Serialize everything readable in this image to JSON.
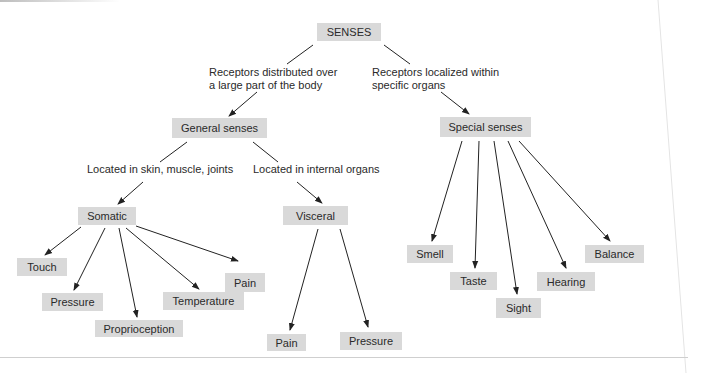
{
  "diagram": {
    "root": "SENSES",
    "branch_labels": {
      "general_line1": "Receptors distributed over",
      "general_line2": "a large part of the body",
      "special_line1": "Receptors localized within",
      "special_line2": "specific organs",
      "somatic": "Located in skin, muscle, joints",
      "visceral": "Located in internal organs"
    },
    "nodes": {
      "general": "General senses",
      "special": "Special senses",
      "somatic": "Somatic",
      "visceral": "Visceral"
    },
    "somatic_children": [
      "Touch",
      "Pressure",
      "Proprioception",
      "Temperature",
      "Pain"
    ],
    "visceral_children": [
      "Pain",
      "Pressure"
    ],
    "special_children": [
      "Smell",
      "Taste",
      "Sight",
      "Hearing",
      "Balance"
    ],
    "colors": {
      "box_fill": "#d9d9d9",
      "line": "#222222"
    }
  }
}
